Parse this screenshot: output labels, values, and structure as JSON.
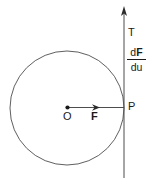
{
  "figure": {
    "background_color": "#ffffff",
    "stroke_color": "#1a1a1a",
    "labels": {
      "tangent": "T",
      "center": "O",
      "vector_f": "F",
      "point_p": "P",
      "derivative_numerator_d": "d",
      "derivative_numerator_f": "F",
      "derivative_denominator": "du"
    },
    "geometry": {
      "circle_center_x": 67,
      "circle_center_y": 108,
      "circle_radius": 57,
      "point_p_x": 124,
      "point_p_y": 108,
      "tangent_arrow_tip_y": 8,
      "tangent_line_bottom_y": 178,
      "vector_arrow_head_x": 99
    }
  }
}
